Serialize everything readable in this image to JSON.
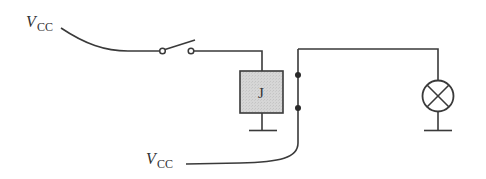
{
  "diagram": {
    "type": "relay circuit schematic",
    "labels": {
      "vcc_top": {
        "main": "V",
        "sub": "CC"
      },
      "vcc_bottom": {
        "main": "V",
        "sub": "CC"
      },
      "relay": "J"
    },
    "components": [
      {
        "id": "switch",
        "kind": "single-pole switch (open)"
      },
      {
        "id": "relay_coil",
        "kind": "relay coil",
        "label": "J"
      },
      {
        "id": "relay_contact",
        "kind": "relay contact (two dots)"
      },
      {
        "id": "lamp",
        "kind": "lamp (circle with X)"
      },
      {
        "id": "ground_relay",
        "kind": "ground"
      },
      {
        "id": "ground_lamp",
        "kind": "ground"
      }
    ],
    "colors": {
      "line": "#3a3a3a",
      "relay_fill": "#d3d3d3",
      "background": "#ffffff"
    }
  }
}
